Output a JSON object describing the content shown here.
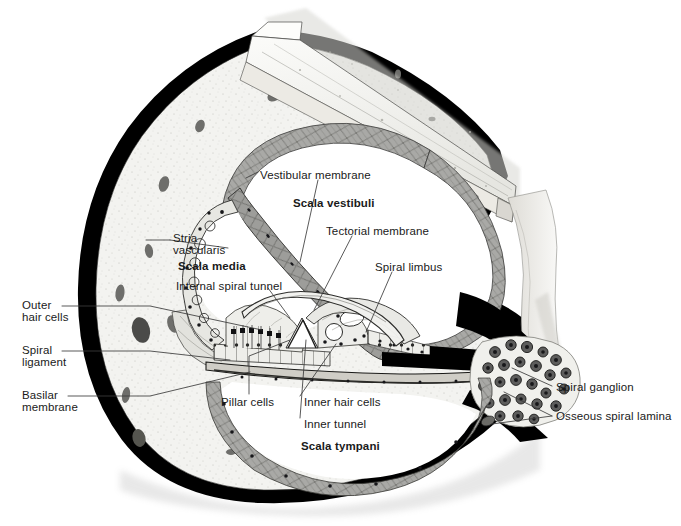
{
  "figure": {
    "type": "anatomical-histology-diagram",
    "background_color": "#ffffff",
    "text_color": "#1a1a1a",
    "bone_fill": "#f2f2ef",
    "membrane_fill": "#a8a8a6",
    "outline_color": "#000000"
  },
  "labels": [
    {
      "id": "vestibular-membrane",
      "text": "Vestibular membrane",
      "bold": false,
      "x": 260,
      "y": 169
    },
    {
      "id": "scala-vestibuli",
      "text": "Scala vestibuli",
      "bold": true,
      "x": 293,
      "y": 197
    },
    {
      "id": "tectorial-membrane",
      "text": "Tectorial membrane",
      "bold": false,
      "x": 326,
      "y": 225
    },
    {
      "id": "spiral-limbus",
      "text": "Spiral limbus",
      "bold": false,
      "x": 375,
      "y": 261
    },
    {
      "id": "stria",
      "text": "Stria",
      "bold": false,
      "x": 173,
      "y": 232
    },
    {
      "id": "vascularis",
      "text": "vascularis",
      "bold": false,
      "x": 173,
      "y": 244
    },
    {
      "id": "scala-media",
      "text": "Scala media",
      "bold": true,
      "x": 178,
      "y": 260
    },
    {
      "id": "internal-spiral-tunnel",
      "text": "Internal spiral tunnel",
      "bold": false,
      "x": 176,
      "y": 280
    },
    {
      "id": "outer-hair-cells-1",
      "text": "Outer",
      "bold": false,
      "x": 22,
      "y": 303
    },
    {
      "id": "outer-hair-cells-2",
      "text": "hair cells",
      "bold": false,
      "x": 22,
      "y": 315
    },
    {
      "id": "spiral-ligament-1",
      "text": "Spiral",
      "bold": false,
      "x": 22,
      "y": 348
    },
    {
      "id": "spiral-ligament-2",
      "text": "ligament",
      "bold": false,
      "x": 22,
      "y": 360
    },
    {
      "id": "basilar-membrane-1",
      "text": "Basilar",
      "bold": false,
      "x": 22,
      "y": 393
    },
    {
      "id": "basilar-membrane-2",
      "text": "membrane",
      "bold": false,
      "x": 22,
      "y": 405
    },
    {
      "id": "pillar-cells",
      "text": "Pillar cells",
      "bold": false,
      "x": 221,
      "y": 400
    },
    {
      "id": "inner-hair-cells",
      "text": "Inner hair cells",
      "bold": false,
      "x": 304,
      "y": 400
    },
    {
      "id": "inner-tunnel",
      "text": "Inner tunnel",
      "bold": false,
      "x": 304,
      "y": 422
    },
    {
      "id": "scala-tympani",
      "text": "Scala tympani",
      "bold": true,
      "x": 301,
      "y": 444
    },
    {
      "id": "spiral-ganglion",
      "text": "Spiral ganglion",
      "bold": false,
      "x": 556,
      "y": 384
    },
    {
      "id": "osseous-spiral-lamina",
      "text": "Osseous spiral lamina",
      "bold": false,
      "x": 556,
      "y": 413
    }
  ],
  "structures": [
    {
      "id": "otic-capsule",
      "name": "Otic capsule bone (black outer rim)"
    },
    {
      "id": "bony-cut-block",
      "name": "Cut bone block, upper right"
    },
    {
      "id": "scala-vestibuli-lumen",
      "name": "Scala vestibuli lumen"
    },
    {
      "id": "scala-media-lumen",
      "name": "Scala media (cochlear duct) lumen"
    },
    {
      "id": "scala-tympani-lumen",
      "name": "Scala tympani lumen"
    },
    {
      "id": "vestibular-membrane-band",
      "name": "Reissner's / vestibular membrane"
    },
    {
      "id": "tectorial-membrane-flap",
      "name": "Tectorial membrane"
    },
    {
      "id": "spiral-limbus-body",
      "name": "Spiral limbus"
    },
    {
      "id": "organ-of-corti",
      "name": "Organ of Corti with hair cells and pillar cells"
    },
    {
      "id": "basilar-membrane-line",
      "name": "Basilar membrane"
    },
    {
      "id": "spiral-ligament-mass",
      "name": "Spiral ligament"
    },
    {
      "id": "stria-vascularis-strip",
      "name": "Stria vascularis"
    },
    {
      "id": "spiral-ganglion-cluster",
      "name": "Spiral ganglion neuron cluster"
    },
    {
      "id": "osseous-spiral-lamina-shelf",
      "name": "Osseous spiral lamina"
    },
    {
      "id": "modiolus-column",
      "name": "Modiolus bone column, right"
    }
  ]
}
